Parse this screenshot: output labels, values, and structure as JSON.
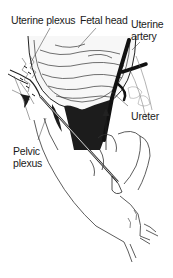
{
  "figure": {
    "type": "anatomical line illustration",
    "labels": {
      "uterine_plexus": "Uterine plexus",
      "fetal_head": "Fetal head",
      "uterine_artery": "Uterine artery",
      "ureter": "Ureter",
      "pelvic_plexus": "Pelvic plexus"
    },
    "colors": {
      "background": "#ffffff",
      "ink": "#1a1a1a",
      "fill_dark": "#1c1c1c"
    }
  }
}
